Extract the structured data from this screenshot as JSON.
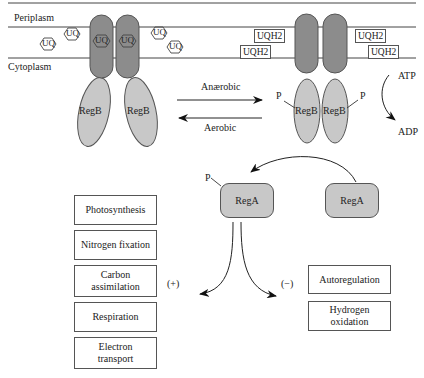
{
  "membrane": {
    "periplasm_label": "Periplasm",
    "cytoplasm_label": "Cytoplasm"
  },
  "left_complex": {
    "quinone_label": "UQ",
    "free_quinones": [
      "UQ",
      "UQ",
      "UQ",
      "UQ"
    ],
    "bound_quinones": [
      "UQ",
      "UQ"
    ],
    "regB_labels": [
      "RegB",
      "RegB"
    ]
  },
  "right_complex": {
    "quinols": [
      "UQH2",
      "UQH2",
      "UQH2",
      "UQH2"
    ],
    "regB_labels": [
      "RegB",
      "RegB"
    ],
    "phosphate_labels": [
      "P",
      "P"
    ]
  },
  "transition": {
    "forward_label": "Anærobic",
    "reverse_label": "Aerobic"
  },
  "atp_cycle": {
    "atp_label": "ATP",
    "adp_label": "ADP"
  },
  "regA": {
    "phosphorylated_label": "RegA",
    "phosphate_label": "P",
    "unphosphorylated_label": "RegA"
  },
  "activated_targets": {
    "sign_label": "(+)",
    "items": [
      {
        "line1": "Photosynthesis",
        "line2": ""
      },
      {
        "line1": "Nitrogen fixation",
        "line2": ""
      },
      {
        "line1": "Carbon",
        "line2": "assimilation"
      },
      {
        "line1": "Respiration",
        "line2": ""
      },
      {
        "line1": "Electron",
        "line2": "transport"
      }
    ]
  },
  "repressed_targets": {
    "sign_label": "(−)",
    "items": [
      {
        "line1": "Autoregulation",
        "line2": ""
      },
      {
        "line1": "Hydrogen",
        "line2": "oxidation"
      }
    ]
  },
  "colors": {
    "receptor_tm": "#8c8c8c",
    "receptor_cyto": "#c8c8c8",
    "line": "#333333"
  }
}
